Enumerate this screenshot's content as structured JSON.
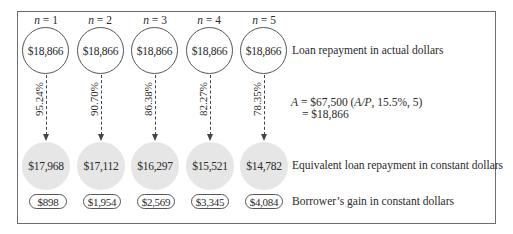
{
  "diagram": {
    "periods": [
      {
        "n_label": "n = 1",
        "n_var": "n",
        "n_value": "1",
        "actual": "$18,866",
        "rate": "95.24%",
        "constant": "$17,968",
        "gain": "$898"
      },
      {
        "n_label": "n = 2",
        "n_var": "n",
        "n_value": "2",
        "actual": "$18,866",
        "rate": "90.70%",
        "constant": "$17,112",
        "gain": "$1,954"
      },
      {
        "n_label": "n = 3",
        "n_var": "n",
        "n_value": "3",
        "actual": "$18,866",
        "rate": "86.38%",
        "constant": "$16,297",
        "gain": "$2,569"
      },
      {
        "n_label": "n = 4",
        "n_var": "n",
        "n_value": "4",
        "actual": "$18,866",
        "rate": "82.27%",
        "constant": "$15,521",
        "gain": "$3,345"
      },
      {
        "n_label": "n = 5",
        "n_var": "n",
        "n_value": "5",
        "actual": "$18,866",
        "rate": "78.35%",
        "constant": "$14,782",
        "gain": "$4,084"
      }
    ],
    "legend": {
      "actual": "Loan repayment in actual dollars",
      "constant": "Equivalent loan repayment in constant dollars",
      "gain": "Borrower’s gain in constant dollars"
    },
    "formula": {
      "var_A": "A",
      "line1_mid": " = $67,500 (",
      "factor": "A/P",
      "line1_end": ", 15.5%, 5)",
      "line2": "= $18,866"
    },
    "colors": {
      "constant_fill": "#e6e6e6",
      "border": "#555555",
      "frame": "#6e6e6e"
    }
  }
}
